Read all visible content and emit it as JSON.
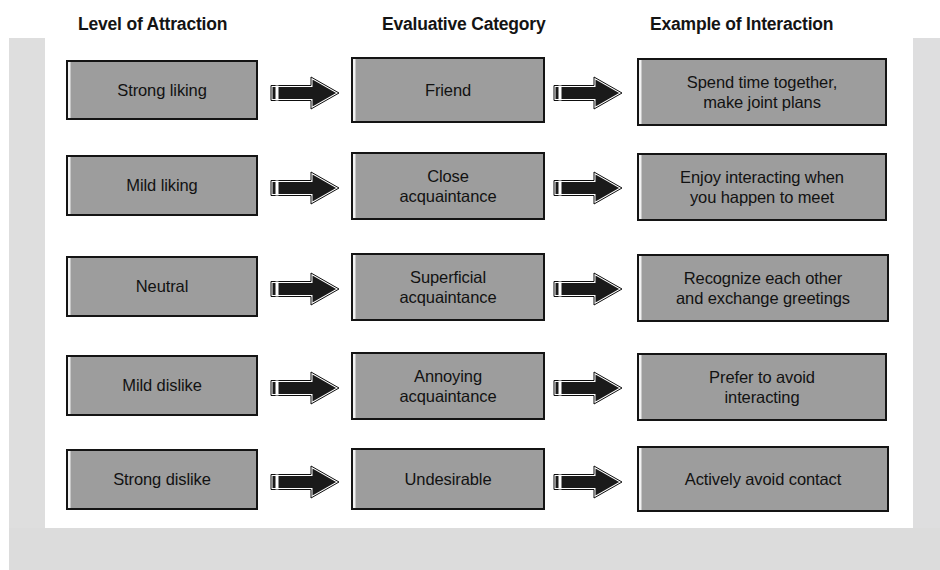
{
  "figure": {
    "type": "flow-diagram",
    "orientation": "left-to-right",
    "columns": 3,
    "rows": 5,
    "headers": [
      "Level of Attraction",
      "Evaluative Category",
      "Example of Interaction"
    ],
    "rows_data": [
      {
        "level_of_attraction": "Strong liking",
        "evaluative_category": "Friend",
        "example_of_interaction": "Spend time together,\nmake joint plans"
      },
      {
        "level_of_attraction": "Mild liking",
        "evaluative_category": "Close\nacquaintance",
        "example_of_interaction": "Enjoy interacting when\nyou happen to meet"
      },
      {
        "level_of_attraction": "Neutral",
        "evaluative_category": "Superficial\nacquaintance",
        "example_of_interaction": "Recognize each other\nand exchange greetings"
      },
      {
        "level_of_attraction": "Mild dislike",
        "evaluative_category": "Annoying\nacquaintance",
        "example_of_interaction": "Prefer to avoid\ninteracting"
      },
      {
        "level_of_attraction": "Strong dislike",
        "evaluative_category": "Undesirable",
        "example_of_interaction": "Actively avoid contact"
      }
    ],
    "connector_icon": "right-block-arrow-icon",
    "colors": {
      "node_fill": "#9d9d9d",
      "node_border": "#141414",
      "arrow_fill": "#1a1a1a",
      "arrow_outline": "#ffffff",
      "page_background": "#ffffff",
      "scan_band": "#dedede",
      "text": "#121212"
    }
  }
}
